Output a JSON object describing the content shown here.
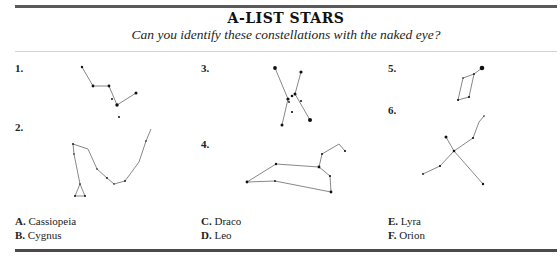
{
  "header": {
    "title": "A-LIST STARS",
    "subtitle": "Can you identify these constellations with the naked eye?"
  },
  "puzzles": [
    {
      "number": "1.",
      "label_pos": [
        15,
        67
      ]
    },
    {
      "number": "2.",
      "label_pos": [
        15,
        125
      ]
    },
    {
      "number": "3.",
      "label_pos": [
        201,
        67
      ]
    },
    {
      "number": "4.",
      "label_pos": [
        201,
        142
      ]
    },
    {
      "number": "5.",
      "label_pos": [
        388,
        67
      ]
    },
    {
      "number": "6.",
      "label_pos": [
        388,
        108
      ]
    }
  ],
  "answers": [
    {
      "letter": "A.",
      "name": "Cassiopeia"
    },
    {
      "letter": "B.",
      "name": "Cygnus"
    },
    {
      "letter": "C.",
      "name": "Draco"
    },
    {
      "letter": "D.",
      "name": "Leo"
    },
    {
      "letter": "E.",
      "name": "Lyra"
    },
    {
      "letter": "F.",
      "name": "Orion"
    }
  ],
  "colors": {
    "line": "#555555",
    "star": "#111111",
    "rule": "#4a4a4a"
  }
}
